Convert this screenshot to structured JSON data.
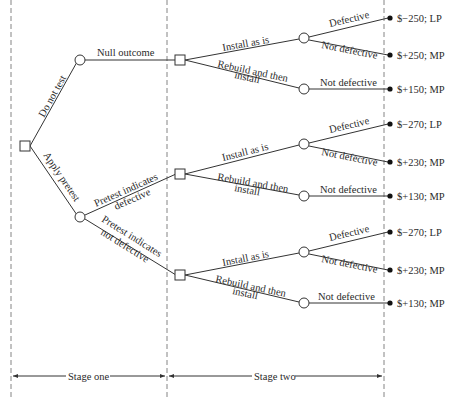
{
  "diagram": {
    "type": "decision-tree",
    "stages": [
      {
        "label": "Stage one"
      },
      {
        "label": "Stage two"
      }
    ],
    "root": {
      "type": "decision"
    },
    "stage_one_branches": [
      {
        "label": "Do not test",
        "outcomes": [
          {
            "label": "Null outcome"
          }
        ]
      },
      {
        "label": "Apply pretest",
        "outcomes": [
          {
            "label_line1": "Pretest indicates",
            "label_line2": "defective"
          },
          {
            "label_line1": "Pretest indicates",
            "label_line2": "not defective"
          }
        ]
      }
    ],
    "stage_two_groups": [
      {
        "install_label": "Install as is",
        "rebuild_label_line1": "Rebuild and then",
        "rebuild_label_line2": "install",
        "install_outcomes": [
          {
            "label": "Defective",
            "payoff": "$−250; LP"
          },
          {
            "label": "Not defective",
            "payoff": "$+250; MP"
          }
        ],
        "rebuild_outcomes": [
          {
            "label": "Not defective",
            "payoff": "$+150; MP"
          }
        ]
      },
      {
        "install_label": "Install as is",
        "rebuild_label_line1": "Rebuild and then",
        "rebuild_label_line2": "install",
        "install_outcomes": [
          {
            "label": "Defective",
            "payoff": "$−270; LP"
          },
          {
            "label": "Not defective",
            "payoff": "$+230; MP"
          }
        ],
        "rebuild_outcomes": [
          {
            "label": "Not defective",
            "payoff": "$+130; MP"
          }
        ]
      },
      {
        "install_label": "Install as is",
        "rebuild_label_line1": "Rebuild and then",
        "rebuild_label_line2": "install",
        "install_outcomes": [
          {
            "label": "Defective",
            "payoff": "$−270; LP"
          },
          {
            "label": "Not defective",
            "payoff": "$+230; MP"
          }
        ],
        "rebuild_outcomes": [
          {
            "label": "Not defective",
            "payoff": "$+130; MP"
          }
        ]
      }
    ]
  }
}
